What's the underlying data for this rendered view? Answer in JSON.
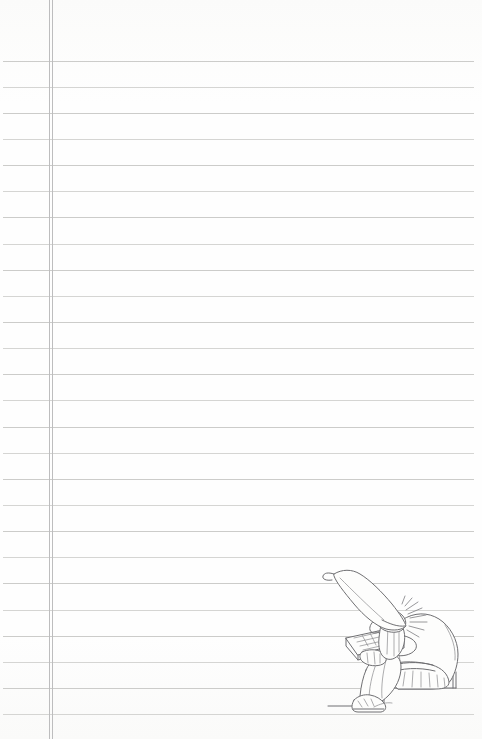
{
  "page": {
    "type": "ruled-notebook-page",
    "width_px": 482,
    "height_px": 739,
    "paper_color": "#fdfdfc",
    "rule_color": "#c9c9c7",
    "margin_color": "#bdbdbe",
    "ink_color": "#6f6f72",
    "text_content": "",
    "is_blank": "true"
  },
  "ruling": {
    "name": "horizontal-rule-lines",
    "count": 26,
    "spacing_px": 26.2,
    "first_line_y": 61,
    "left_inset_px": 3,
    "right_inset_px": 8,
    "line_y_positions": [
      61,
      87,
      113,
      139,
      165,
      191,
      217,
      244,
      270,
      296,
      322,
      348,
      374,
      400,
      427,
      453,
      479,
      505,
      531,
      557,
      583,
      610,
      636,
      662,
      688,
      714
    ]
  },
  "margin": {
    "name": "vertical-margin-rule",
    "style": "double-line",
    "line_a_x": 49,
    "line_b_x": 52,
    "color": "#bdbdbe"
  },
  "illustration": {
    "name": "gnome-with-keyboard",
    "subject": "gnome",
    "position": "bottom-right",
    "style": "pencil line art",
    "bbox": {
      "x": 306,
      "y": 560,
      "width": 176,
      "height": 179
    },
    "elements": [
      {
        "name": "pointed-hat",
        "label": "tall pointed gnome hat curving left"
      },
      {
        "name": "spiky-hair",
        "label": "spiky hair at back of head"
      },
      {
        "name": "beard",
        "label": "pointed beard"
      },
      {
        "name": "face-profile",
        "label": "face in left-facing profile with long nose"
      },
      {
        "name": "keyboard",
        "label": "keyboard / typewriter held on lap"
      },
      {
        "name": "hands",
        "label": "hands resting on keyboard"
      },
      {
        "name": "tunic",
        "label": "hunched back and tunic"
      },
      {
        "name": "belt",
        "label": "belt at waist"
      },
      {
        "name": "trousers",
        "label": "trousers with fold lines"
      },
      {
        "name": "boots",
        "label": "pointed boots"
      },
      {
        "name": "step-ledge",
        "label": "step or ledge the gnome sits on"
      }
    ]
  }
}
